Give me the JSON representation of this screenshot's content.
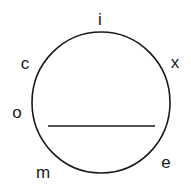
{
  "diagram": {
    "shape": "circle",
    "stroke_color": "#1a1a1a",
    "background": "#ffffff",
    "labels": [
      {
        "text": "i",
        "position": "top"
      },
      {
        "text": "c",
        "position": "upper-left"
      },
      {
        "text": "x",
        "position": "upper-right"
      },
      {
        "text": "o",
        "position": "left"
      },
      {
        "text": "m",
        "position": "lower-left"
      },
      {
        "text": "e",
        "position": "lower-right"
      }
    ],
    "chord": {
      "orientation": "horizontal",
      "position": "below-center"
    }
  }
}
